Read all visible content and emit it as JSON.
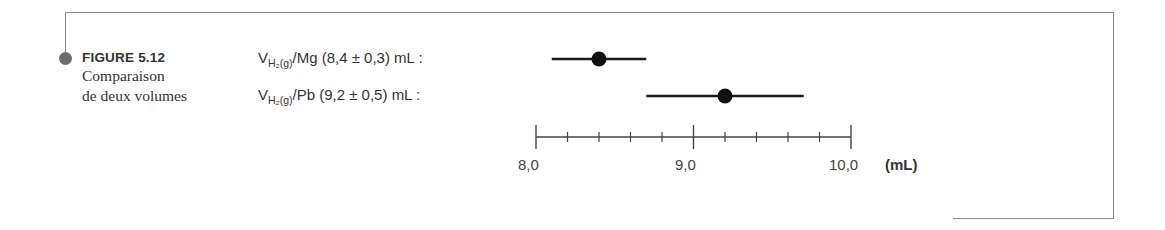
{
  "figure": {
    "number": "FIGURE 5.12",
    "caption_line1": "Comparaison",
    "caption_line2": "de deux volumes"
  },
  "rows": [
    {
      "var": "V",
      "sub": "H2(g)",
      "sub_display": "H₂(g)",
      "metal": "/Mg (8,4 ± 0,3) mL :"
    },
    {
      "var": "V",
      "sub": "H2(g)",
      "sub_display": "H₂(g)",
      "metal": "/Pb (9,2 ± 0,5) mL :"
    }
  ],
  "axis": {
    "labels": [
      "8,0",
      "9,0",
      "10,0"
    ],
    "unit": "(mL)"
  },
  "chart_data": {
    "type": "scatter",
    "subtype": "error-bar",
    "title": "Comparaison de deux volumes",
    "categories": [
      "V H2(g)/Mg",
      "V H2(g)/Pb"
    ],
    "values": [
      8.4,
      9.2
    ],
    "errors": [
      0.3,
      0.5
    ],
    "intervals": [
      [
        8.1,
        8.7
      ],
      [
        8.7,
        9.7
      ]
    ],
    "xlabel": "(mL)",
    "ylabel": "",
    "xlim": [
      8.0,
      10.0
    ],
    "major_ticks": [
      8.0,
      9.0,
      10.0
    ],
    "minor_tick_step": 0.2,
    "tick_labels": [
      "8,0",
      "9,0",
      "10,0"
    ],
    "grid": false,
    "legend": "none"
  }
}
